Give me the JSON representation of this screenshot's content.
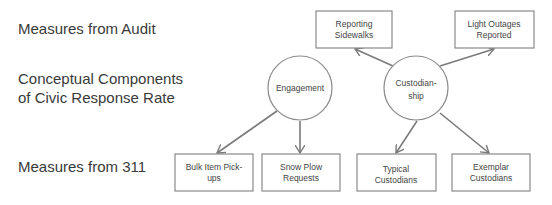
{
  "row_labels": {
    "audit": "Measures from Audit",
    "components_line1": "Conceptual Components",
    "components_line2": "of Civic Response Rate",
    "311": "Measures from 311"
  },
  "components": [
    {
      "id": "engagement",
      "lines": [
        "Engagement"
      ]
    },
    {
      "id": "custodianship",
      "lines": [
        "Custodian-",
        "ship"
      ]
    }
  ],
  "measures": [
    {
      "id": "reporting-sidewalks",
      "source": "audit",
      "lines": [
        "Reporting",
        "Sidewalks"
      ],
      "from": "custodianship"
    },
    {
      "id": "light-outages",
      "source": "audit",
      "lines": [
        "Light Outages",
        "Reported"
      ],
      "from": "custodianship"
    },
    {
      "id": "bulk-item",
      "source": "311",
      "lines": [
        "Bulk Item Pick-",
        "ups"
      ],
      "from": "engagement"
    },
    {
      "id": "snow-plow",
      "source": "311",
      "lines": [
        "Snow Plow",
        "Requests"
      ],
      "from": "engagement"
    },
    {
      "id": "typical-custodians",
      "source": "311",
      "lines": [
        "Typical",
        "Custodians"
      ],
      "from": "custodianship"
    },
    {
      "id": "exemplar-custodians",
      "source": "311",
      "lines": [
        "Exemplar",
        "Custodians"
      ],
      "from": "custodianship"
    }
  ],
  "colors": {
    "stroke": "#8a8a8a",
    "arrow": "#7a7a7a",
    "text": "#3a3a3a"
  }
}
